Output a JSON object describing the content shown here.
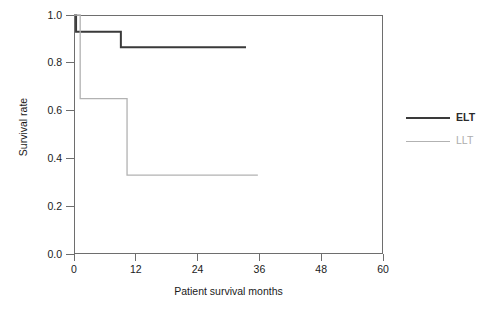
{
  "chart_data": {
    "type": "line",
    "subtype": "kaplan-meier-step",
    "title": "",
    "xlabel": "Patient survival months",
    "ylabel": "Survival rate",
    "xlim": [
      0,
      60
    ],
    "ylim": [
      0.0,
      1.0
    ],
    "xticks": [
      0,
      12,
      24,
      36,
      48,
      60
    ],
    "xtick_labels": [
      "0",
      "12",
      "24",
      "36",
      "48",
      "60"
    ],
    "yticks": [
      0.0,
      0.2,
      0.4,
      0.6,
      0.8,
      1.0
    ],
    "ytick_labels": [
      "0.0",
      "0.2",
      "0.4",
      "0.6",
      "0.8",
      "1.0"
    ],
    "grid": false,
    "legend_position": "right",
    "frame": "box",
    "series": [
      {
        "name": "ELT",
        "color": "#3a3a3a",
        "line_width": 2.0,
        "steps": [
          {
            "x": 0.0,
            "y": 1.0
          },
          {
            "x": 0.4,
            "y": 1.0
          },
          {
            "x": 0.4,
            "y": 0.93
          },
          {
            "x": 9.1,
            "y": 0.93
          },
          {
            "x": 9.1,
            "y": 0.865
          },
          {
            "x": 33.4,
            "y": 0.865
          }
        ]
      },
      {
        "name": "LLT",
        "color": "#b2b2b2",
        "line_width": 1.3,
        "steps": [
          {
            "x": 0.0,
            "y": 1.0
          },
          {
            "x": 1.2,
            "y": 1.0
          },
          {
            "x": 1.2,
            "y": 0.65
          },
          {
            "x": 10.3,
            "y": 0.65
          },
          {
            "x": 10.3,
            "y": 0.33
          },
          {
            "x": 35.7,
            "y": 0.33
          }
        ]
      }
    ]
  },
  "legend": {
    "items": [
      {
        "label": "ELT",
        "color": "#3a3a3a"
      },
      {
        "label": "LLT",
        "color": "#b2b2b2"
      }
    ]
  },
  "axes": {
    "x_title": "Patient survival months",
    "y_title": "Survival rate",
    "x_labels": [
      "0",
      "12",
      "24",
      "36",
      "48",
      "60"
    ],
    "y_labels": [
      "0.0",
      "0.2",
      "0.4",
      "0.6",
      "0.8",
      "1.0"
    ]
  },
  "colors": {
    "elt": "#3a3a3a",
    "llt": "#b2b2b2",
    "axis": "#6e6e6e",
    "text": "#1a1a1a",
    "background": "#ffffff"
  }
}
